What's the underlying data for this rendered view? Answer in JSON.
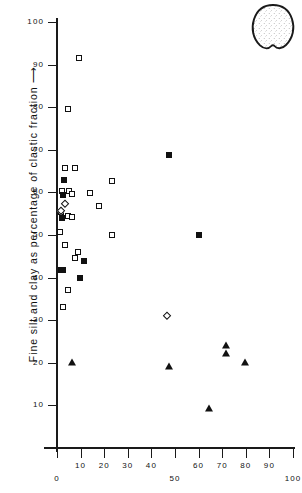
{
  "figure": {
    "inset_icon": "stippled-clast-outline"
  },
  "chart_data": {
    "type": "scatter",
    "title": "",
    "xlabel": "",
    "ylabel": "Fine silt and clay as percentage of clastic fraction ⟶",
    "xlim": [
      0,
      100
    ],
    "ylim": [
      0,
      100
    ],
    "grid": false,
    "legend": "none",
    "x_ticks": [
      {
        "value": 0,
        "label": "0",
        "row": 2
      },
      {
        "value": 10,
        "label": "10",
        "row": 1
      },
      {
        "value": 20,
        "label": "20",
        "row": 1
      },
      {
        "value": 30,
        "label": "30",
        "row": 1
      },
      {
        "value": 40,
        "label": "40",
        "row": 1
      },
      {
        "value": 50,
        "label": "50",
        "row": 2
      },
      {
        "value": 60,
        "label": "60",
        "row": 1
      },
      {
        "value": 70,
        "label": "70",
        "row": 1
      },
      {
        "value": 80,
        "label": "80",
        "row": 1
      },
      {
        "value": 90,
        "label": "90",
        "row": 1
      },
      {
        "value": 100,
        "label": "100",
        "row": 2
      }
    ],
    "y_ticks": [
      {
        "value": 10,
        "label": "10"
      },
      {
        "value": 20,
        "label": "20"
      },
      {
        "value": 30,
        "label": "30"
      },
      {
        "value": 40,
        "label": "40"
      },
      {
        "value": 50,
        "label": "50"
      },
      {
        "value": 60,
        "label": "60"
      },
      {
        "value": 70,
        "label": "70"
      },
      {
        "value": 80,
        "label": "80"
      },
      {
        "value": 90,
        "label": "90"
      },
      {
        "value": 100,
        "label": "100"
      }
    ],
    "series": [
      {
        "name": "open-square",
        "marker": "square-open",
        "points": [
          [
            9.5,
            91.5
          ],
          [
            4.5,
            79.5
          ],
          [
            3.5,
            65.8
          ],
          [
            7.5,
            65.8
          ],
          [
            2.0,
            60.3
          ],
          [
            5.0,
            60.3
          ],
          [
            6.5,
            59.6
          ],
          [
            14.0,
            59.8
          ],
          [
            23.5,
            62.7
          ],
          [
            18.0,
            56.9
          ],
          [
            1.6,
            55.3
          ],
          [
            4.6,
            54.4
          ],
          [
            6.2,
            54.3
          ],
          [
            1.4,
            50.8
          ],
          [
            3.4,
            47.6
          ],
          [
            9.0,
            46.0
          ],
          [
            7.6,
            44.7
          ],
          [
            23.5,
            49.9
          ],
          [
            4.6,
            37.0
          ],
          [
            2.6,
            33.0
          ]
        ]
      },
      {
        "name": "filled-square",
        "marker": "square-filled",
        "points": [
          [
            2.8,
            62.8
          ],
          [
            2.4,
            59.3
          ],
          [
            2.2,
            54.0
          ],
          [
            1.7,
            41.8
          ],
          [
            2.5,
            41.9
          ],
          [
            11.5,
            43.8
          ],
          [
            9.6,
            39.9
          ],
          [
            47.5,
            68.7
          ],
          [
            60.0,
            50.1
          ]
        ]
      },
      {
        "name": "open-diamond",
        "marker": "diamond-open",
        "points": [
          [
            3.6,
            57.2
          ],
          [
            1.5,
            55.6
          ],
          [
            46.8,
            31.0
          ]
        ]
      },
      {
        "name": "filled-triangle",
        "marker": "triangle-filled",
        "points": [
          [
            6.5,
            20.3
          ],
          [
            47.5,
            19.2
          ],
          [
            71.8,
            24.2
          ],
          [
            71.8,
            22.2
          ],
          [
            79.5,
            20.2
          ],
          [
            64.5,
            9.3
          ]
        ]
      }
    ]
  }
}
